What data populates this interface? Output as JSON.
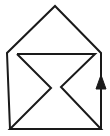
{
  "figure": {
    "canvas": {
      "width": 110,
      "height": 136,
      "background": "#ffffff"
    },
    "stroke": {
      "color": "#1a1a1a",
      "width": 2
    },
    "shapes": {
      "outer_outline": {
        "name": "house-outline",
        "description": "open polyline: left bottom up the left side, up-right to peak, down-right to right side, down to bottom right",
        "points": "10,129 7,53 55,6 101,53 101,129"
      },
      "inner_zigzag": {
        "name": "zigzag-arrow-shape",
        "description": "Z / bowtie-like folded band inside the house",
        "points": "17,54 95,54 61,87 101,129 10,129 51,88 17,54"
      },
      "up_arrow_shaft": {
        "name": "up-arrow-shaft",
        "x": 101,
        "y_top": 76,
        "y_bottom": 129
      },
      "up_arrow_head": {
        "name": "up-arrow-head",
        "points": "101,75 106,89 96,89",
        "direction": "up"
      }
    }
  }
}
